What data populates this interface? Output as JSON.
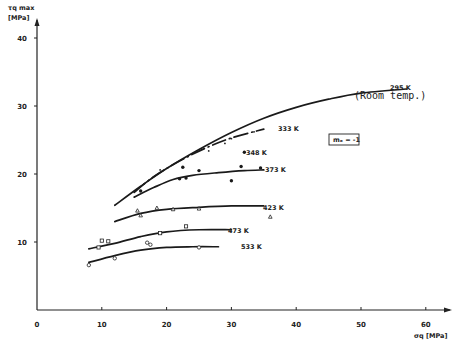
{
  "chart_data": {
    "type": "line",
    "title": "",
    "xlabel": "σ_q [MPa]",
    "ylabel": "τ_q max [MPa]",
    "xlim": [
      0,
      65
    ],
    "ylim": [
      0,
      42
    ],
    "xticks": [
      0,
      10,
      20,
      30,
      40,
      50,
      60
    ],
    "yticks": [
      10,
      20,
      30,
      40
    ],
    "grid": false,
    "legend_position": "inline labels at curve ends",
    "annotations": [
      "m_e = -1",
      "(Room temp.)",
      "348 K"
    ],
    "series": [
      {
        "name": "295 K",
        "note": "(Room temp.)",
        "style": "solid",
        "marker": "none",
        "x": [
          12,
          16,
          20,
          25,
          30,
          35,
          40,
          45,
          50,
          57
        ],
        "y": [
          15.4,
          18.2,
          20.8,
          23.6,
          26.1,
          28.2,
          29.8,
          31.0,
          31.9,
          32.5
        ],
        "points": []
      },
      {
        "name": "333 K",
        "style": "dash-dot",
        "marker": "dot",
        "x": [
          15,
          18,
          22,
          26,
          30,
          35
        ],
        "y": [
          17.3,
          19.6,
          21.9,
          23.8,
          25.3,
          26.6
        ],
        "points": [
          [
            16.5,
            18.5
          ],
          [
            19,
            20.6
          ],
          [
            26.5,
            23.4
          ],
          [
            29,
            24.5
          ],
          [
            30,
            25.2
          ],
          [
            33.5,
            26.2
          ]
        ]
      },
      {
        "name": "348 K",
        "style": "none",
        "marker": "filled-circle",
        "x": [],
        "y": [],
        "points": [
          [
            32,
            23.2
          ]
        ]
      },
      {
        "name": "373 K",
        "style": "solid",
        "marker": "filled-circle",
        "x": [
          15,
          18,
          21,
          24,
          28,
          32,
          35
        ],
        "y": [
          16.6,
          18.0,
          19.2,
          19.8,
          20.2,
          20.5,
          20.6
        ],
        "points": [
          [
            16,
            17.5
          ],
          [
            22,
            19.3
          ],
          [
            23,
            19.4
          ],
          [
            22.5,
            21.0
          ],
          [
            25,
            20.5
          ],
          [
            30,
            19.0
          ],
          [
            31.5,
            21.1
          ],
          [
            34.5,
            20.9
          ]
        ]
      },
      {
        "name": "423 K",
        "style": "solid",
        "marker": "open-triangle",
        "x": [
          12,
          16,
          20,
          25,
          30,
          35
        ],
        "y": [
          13.0,
          14.2,
          14.8,
          15.1,
          15.3,
          15.3
        ],
        "points": [
          [
            15.5,
            14.6
          ],
          [
            16,
            13.9
          ],
          [
            18.5,
            15.0
          ],
          [
            21,
            14.8
          ],
          [
            25,
            14.9
          ],
          [
            36,
            13.7
          ]
        ]
      },
      {
        "name": "473 K",
        "style": "solid",
        "marker": "open-square",
        "x": [
          8,
          12,
          16,
          20,
          25,
          30
        ],
        "y": [
          9.0,
          9.8,
          10.8,
          11.5,
          11.8,
          11.8
        ],
        "points": [
          [
            9.5,
            9.2
          ],
          [
            10,
            10.2
          ],
          [
            11,
            10.1
          ],
          [
            19,
            11.3
          ],
          [
            23,
            12.3
          ]
        ]
      },
      {
        "name": "533 K",
        "style": "solid",
        "marker": "open-circle",
        "x": [
          8,
          12,
          16,
          20,
          24,
          28
        ],
        "y": [
          7.0,
          8.0,
          8.8,
          9.2,
          9.3,
          9.3
        ],
        "points": [
          [
            8,
            6.6
          ],
          [
            12,
            7.6
          ],
          [
            17,
            9.9
          ],
          [
            17.5,
            9.6
          ],
          [
            25,
            9.2
          ]
        ]
      }
    ]
  },
  "labels": {
    "y_axis_title_line1": "τq max",
    "y_axis_title_line2": "[MPa]",
    "x_axis_title": "σq [MPa]",
    "room_temp": "(Room temp.)",
    "me_box": "mₑ = -1",
    "label_348": "348 K"
  }
}
